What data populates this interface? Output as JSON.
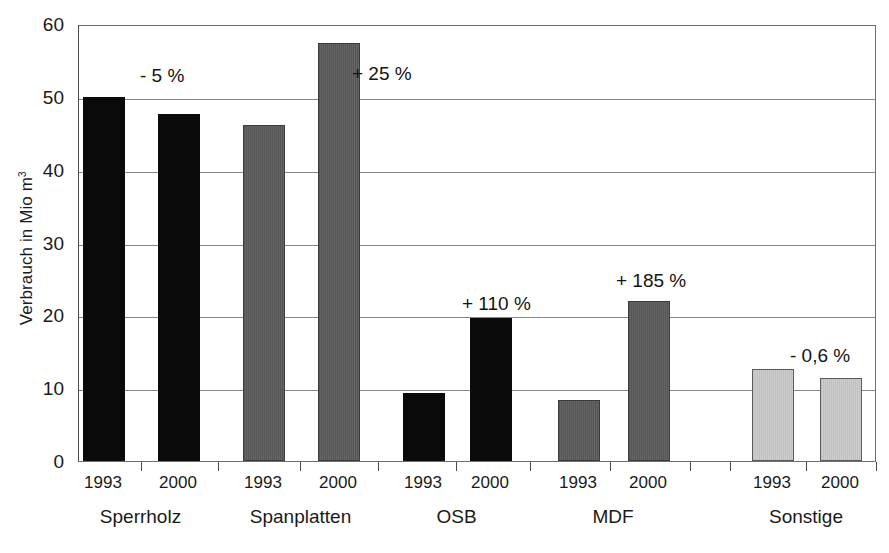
{
  "chart_data": {
    "type": "bar",
    "title": "",
    "xlabel": "",
    "ylabel": "Verbrauch in Mio m",
    "ylabel_superscript": "3",
    "ylim": [
      0,
      60
    ],
    "yticks": [
      0,
      10,
      20,
      30,
      40,
      50,
      60
    ],
    "ytick_labels": [
      "0",
      "10",
      "20",
      "30",
      "40",
      "50",
      "60"
    ],
    "grid": "horizontal",
    "legend": "none",
    "categories": [
      "Sperrholz",
      "Spanplatten",
      "OSB",
      "MDF",
      "Sonstige"
    ],
    "x": [
      "1993",
      "2000"
    ],
    "series": [
      {
        "name": "1993",
        "values": [
          50.0,
          46.2,
          9.4,
          8.4,
          12.7
        ]
      },
      {
        "name": "2000",
        "values": [
          47.7,
          57.4,
          19.6,
          22.0,
          11.4
        ]
      }
    ],
    "groups": [
      {
        "category": "Sperrholz",
        "color": "#0a0a0a",
        "fill_style": "solid-black",
        "annotation": "- 5 %",
        "bars": [
          {
            "year": "1993",
            "value": 50.0
          },
          {
            "year": "2000",
            "value": 47.7
          }
        ]
      },
      {
        "category": "Spanplatten",
        "color": "#5a5a5a",
        "fill_style": "dark-gray-vertical-hatch",
        "annotation": "+ 25 %",
        "bars": [
          {
            "year": "1993",
            "value": 46.2
          },
          {
            "year": "2000",
            "value": 57.4
          }
        ]
      },
      {
        "category": "OSB",
        "color": "#0a0a0a",
        "fill_style": "solid-black",
        "annotation": "+ 110 %",
        "bars": [
          {
            "year": "1993",
            "value": 9.4
          },
          {
            "year": "2000",
            "value": 19.6
          }
        ]
      },
      {
        "category": "MDF",
        "color": "#5a5a5a",
        "fill_style": "dark-gray-vertical-hatch",
        "annotation": "+ 185 %",
        "bars": [
          {
            "year": "1993",
            "value": 8.4
          },
          {
            "year": "2000",
            "value": 22.0
          }
        ]
      },
      {
        "category": "Sonstige",
        "color": "#c4c4c4",
        "fill_style": "light-gray-vertical-hatch",
        "annotation": "- 0,6 %",
        "bars": [
          {
            "year": "1993",
            "value": 12.7
          },
          {
            "year": "2000",
            "value": 11.4
          }
        ]
      }
    ],
    "annotations": [
      "- 5 %",
      "+ 25 %",
      "+ 110 %",
      "+ 185 %",
      "- 0,6 %"
    ]
  },
  "layout": {
    "plot_left": 78,
    "plot_top": 25,
    "plot_width": 798,
    "plot_height": 437,
    "bar_width": 42,
    "bar_centers": [
      [
        103,
        178
      ],
      [
        263,
        338
      ],
      [
        423,
        490
      ],
      [
        578,
        648
      ],
      [
        772,
        840
      ]
    ],
    "annotation_positions": [
      {
        "x": 140,
        "y": 65
      },
      {
        "x": 352,
        "y": 63
      },
      {
        "x": 462,
        "y": 293
      },
      {
        "x": 616,
        "y": 270
      },
      {
        "x": 790,
        "y": 345
      }
    ],
    "x_tick_positions": [
      141,
      218,
      300,
      378,
      456,
      530,
      610,
      690,
      730,
      806,
      876
    ]
  }
}
